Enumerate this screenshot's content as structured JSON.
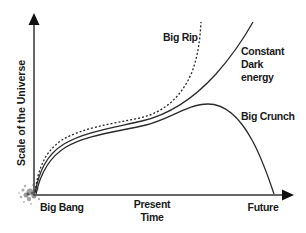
{
  "diagram": {
    "y_axis_label": "Scale of the Universe",
    "x_axis_labels": {
      "origin": "Big Bang",
      "present_line1": "Present",
      "present_line2": "Time",
      "future": "Future"
    },
    "curves": [
      {
        "name": "big-rip",
        "label": "Big Rip",
        "style": "dotted"
      },
      {
        "name": "constant-dark-energy",
        "label_line1": "Constant",
        "label_line2": "Dark",
        "label_line3": "energy",
        "style": "solid"
      },
      {
        "name": "big-crunch",
        "label": "Big Crunch",
        "style": "solid"
      }
    ],
    "colors": {
      "line": "#2a2a2a",
      "axis": "#333333",
      "text": "#1a1a1a",
      "background": "#ffffff"
    }
  }
}
